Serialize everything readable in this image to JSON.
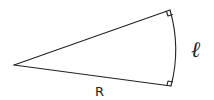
{
  "diagram": {
    "type": "circular-sector",
    "labels": {
      "arc": "ℓ",
      "radius": "R"
    },
    "right_angle_markers": 2,
    "colors": {
      "stroke": "#222222",
      "background": "#ffffff"
    }
  }
}
